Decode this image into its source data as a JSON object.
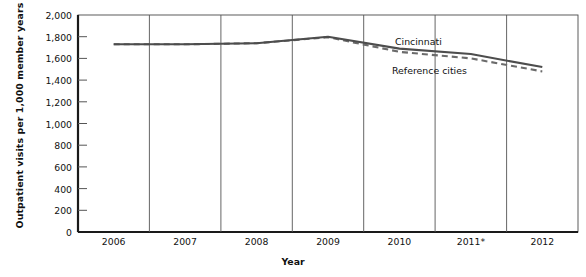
{
  "axes": {
    "ylabel": "Outpatient visits per 1,000 member years",
    "xlabel": "Year",
    "ytick_labels": [
      "2,000",
      "1,800",
      "1,600",
      "1,400",
      "1,200",
      "1,000",
      "800",
      "600",
      "400",
      "200",
      "0"
    ],
    "xtick_labels": [
      "2006",
      "2007",
      "2008",
      "2009",
      "2010",
      "2011*",
      "2012"
    ]
  },
  "legend": {
    "cincinnati": "Cincinnati",
    "reference": "Reference cities"
  },
  "colors": {
    "axis": "#1a1a1a",
    "cincinnati_line": "#4d4d4d",
    "reference_line": "#6b6b6b",
    "text": "#111111",
    "background": "#ffffff"
  },
  "chart_data": {
    "type": "line",
    "title": "",
    "xlabel": "Year",
    "ylabel": "Outpatient visits per 1,000 member years",
    "categories": [
      "2006",
      "2007",
      "2008",
      "2009",
      "2010",
      "2011*",
      "2012"
    ],
    "series": [
      {
        "name": "Cincinnati",
        "style": "solid",
        "values": [
          1730,
          1730,
          1740,
          1800,
          1690,
          1640,
          1520
        ]
      },
      {
        "name": "Reference cities",
        "style": "dashed",
        "values": [
          1730,
          1730,
          1740,
          1795,
          1660,
          1600,
          1480
        ]
      }
    ],
    "ylim": [
      0,
      2000
    ],
    "ytick_values": [
      0,
      200,
      400,
      600,
      800,
      1000,
      1200,
      1400,
      1600,
      1800,
      2000
    ],
    "grid": false,
    "legend_position": "inline-annotation"
  }
}
